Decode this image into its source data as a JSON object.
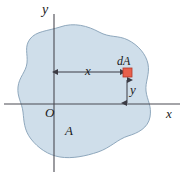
{
  "figure": {
    "background_color": "#ffffff",
    "region": {
      "name": "A",
      "fill_color": "#cfdeea",
      "stroke_color": "#8fa8bd",
      "label": "A"
    },
    "axes": {
      "color": "#4a4a52",
      "x_label": "x",
      "y_label": "y",
      "origin_label": "O"
    },
    "element": {
      "label": "dA",
      "fill_color": "#e8604c",
      "stroke_color": "#b5392a"
    },
    "dimensions": {
      "horizontal_label": "x",
      "vertical_label": "y",
      "line_color": "#3b3b44"
    }
  }
}
